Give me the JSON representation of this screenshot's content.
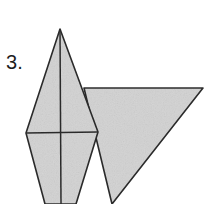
{
  "figure": {
    "label": "3.",
    "background_color": "#ffffff",
    "fill_color": "#d2d2d2",
    "stroke_color": "#2b2b2b",
    "canvas": {
      "width": 207,
      "height": 204
    },
    "shapes": [
      {
        "name": "right-triangle",
        "type": "polygon",
        "points": "84,88 203,88 112,204",
        "vertices": [
          {
            "x": 84,
            "y": 88
          },
          {
            "x": 203,
            "y": 88
          },
          {
            "x": 112,
            "y": 204
          }
        ]
      },
      {
        "name": "kite",
        "type": "polygon",
        "points": "60,29 98,132 76,204 45,204 26,133",
        "vertices": [
          {
            "x": 60,
            "y": 29
          },
          {
            "x": 98,
            "y": 132
          },
          {
            "x": 76,
            "y": 204
          },
          {
            "x": 45,
            "y": 204
          },
          {
            "x": 26,
            "y": 133
          }
        ]
      }
    ],
    "internal_lines": [
      {
        "name": "kite-vertical-axis",
        "x1": 60,
        "y1": 29,
        "x2": 61,
        "y2": 204
      },
      {
        "name": "kite-horizontal-diagonal",
        "x1": 26,
        "y1": 133,
        "x2": 98,
        "y2": 132
      }
    ]
  }
}
